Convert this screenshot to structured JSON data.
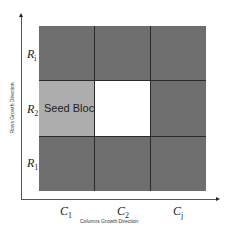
{
  "axes": {
    "x_title": "Columns Growth Direction",
    "y_title": "Rows Growth Direction"
  },
  "rows": [
    {
      "label": "R",
      "sub": "i"
    },
    {
      "label": "R",
      "sub": "2"
    },
    {
      "label": "R",
      "sub": "1"
    }
  ],
  "columns": [
    {
      "label": "C",
      "sub": "1"
    },
    {
      "label": "C",
      "sub": "2"
    },
    {
      "label": "C",
      "sub": "j"
    }
  ],
  "grid": {
    "cells": [
      [
        "dark",
        "dark",
        "dark"
      ],
      [
        "seed",
        "empty",
        "dark"
      ],
      [
        "dark",
        "dark",
        "dark"
      ]
    ],
    "seed_label": "Seed Block"
  },
  "colors": {
    "dark_block": "#6e6e6e",
    "seed_block": "#adadad",
    "empty_block": "#ffffff",
    "grid_line": "#2a2a2a"
  }
}
